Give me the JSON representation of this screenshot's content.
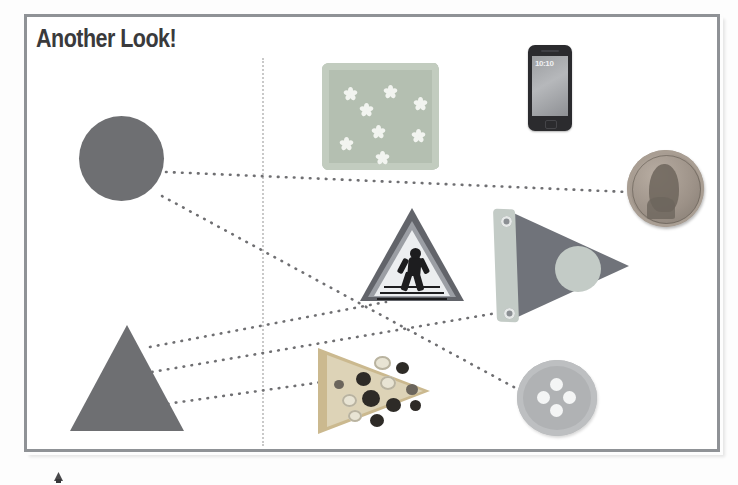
{
  "page": {
    "title": "Another Look!",
    "frame_color": "#8f9296",
    "background": "#ffffff",
    "shape_fill": "#6e6f72"
  },
  "divider": {
    "name": "vertical-dotted-divider",
    "style": "dotted",
    "color": "#c9c9c9"
  },
  "left_shapes": [
    {
      "id": "circle",
      "label": "circle",
      "fill": "#6e6f72"
    },
    {
      "id": "triangle",
      "label": "triangle",
      "fill": "#6e6f72"
    }
  ],
  "objects": [
    {
      "id": "napkin",
      "label": "floral napkin",
      "shape": "square",
      "color": "#b4bfb1"
    },
    {
      "id": "phone",
      "label": "smartphone",
      "shape": "rectangle",
      "color": "#2b2b2e",
      "screen_time": "10:10"
    },
    {
      "id": "penny",
      "label": "penny",
      "shape": "circle",
      "color": "#9d9288"
    },
    {
      "id": "sign",
      "label": "pedestrian crossing sign",
      "shape": "triangle",
      "color": "#62646a"
    },
    {
      "id": "pennant",
      "label": "pennant flag",
      "shape": "triangle",
      "color": "#70737a"
    },
    {
      "id": "pizza",
      "label": "pizza slice",
      "shape": "triangle",
      "color": "#cbb98f"
    },
    {
      "id": "button",
      "label": "sewing button",
      "shape": "circle",
      "color": "#b0b2b4"
    }
  ],
  "connections": [
    {
      "from": "circle",
      "to": "penny"
    },
    {
      "from": "circle",
      "to": "button"
    },
    {
      "from": "triangle",
      "to": "sign"
    },
    {
      "from": "triangle",
      "to": "pennant"
    },
    {
      "from": "triangle",
      "to": "pizza"
    }
  ]
}
